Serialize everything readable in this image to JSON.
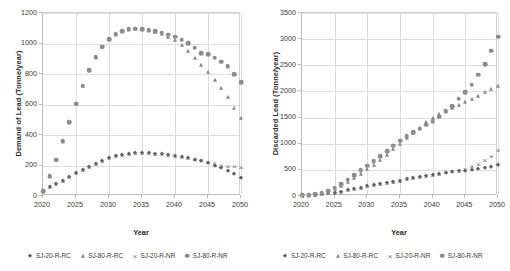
{
  "figure": {
    "panels": [
      "left",
      "right"
    ]
  },
  "series_meta": [
    {
      "key": "sj20rrc",
      "label": "SJ-20-R-RC",
      "marker": "diamond",
      "color": "#5f5f5f"
    },
    {
      "key": "sj80rrc",
      "label": "SJ-80-R-RC",
      "marker": "triangle",
      "color": "#8a8a8a"
    },
    {
      "key": "sj20rnr",
      "label": "SJ-20-R-NR",
      "marker": "cross",
      "color": "#6e6e6e"
    },
    {
      "key": "sj80rnr",
      "label": "SJ-80-R-NR",
      "marker": "circle",
      "color": "#8d8d8d"
    }
  ],
  "chart_data": [
    {
      "type": "scatter",
      "panel": "left",
      "title": "",
      "xlabel": "Year",
      "ylabel": "Demand of Lead (Tonne/year)",
      "xlim": [
        2020,
        2050
      ],
      "ylim": [
        0,
        1200
      ],
      "yticks": [
        0,
        200,
        400,
        600,
        800,
        1000,
        1200
      ],
      "xticks": [
        2020,
        2025,
        2030,
        2035,
        2040,
        2045,
        2050
      ],
      "grid": true,
      "legend_position": "bottom",
      "x": [
        2020,
        2021,
        2022,
        2023,
        2024,
        2025,
        2026,
        2027,
        2028,
        2029,
        2030,
        2031,
        2032,
        2033,
        2034,
        2035,
        2036,
        2037,
        2038,
        2039,
        2040,
        2041,
        2042,
        2043,
        2044,
        2045,
        2046,
        2047,
        2048,
        2049,
        2050
      ],
      "series": [
        {
          "name": "SJ-20-R-RC",
          "marker": "diamond",
          "values": [
            30,
            60,
            78,
            100,
            122,
            148,
            170,
            192,
            212,
            232,
            248,
            262,
            270,
            276,
            280,
            282,
            281,
            278,
            274,
            268,
            262,
            254,
            246,
            238,
            228,
            215,
            200,
            182,
            165,
            142,
            120
          ]
        },
        {
          "name": "SJ-80-R-RC",
          "marker": "triangle",
          "values": [
            30,
            130,
            238,
            360,
            482,
            606,
            724,
            824,
            912,
            980,
            1030,
            1062,
            1082,
            1092,
            1096,
            1094,
            1086,
            1074,
            1060,
            1042,
            1020,
            988,
            950,
            908,
            858,
            812,
            762,
            708,
            646,
            576,
            510
          ]
        },
        {
          "name": "SJ-20-R-NR",
          "marker": "cross",
          "values": [
            30,
            60,
            78,
            100,
            122,
            148,
            170,
            192,
            212,
            232,
            248,
            262,
            270,
            276,
            280,
            282,
            281,
            278,
            274,
            268,
            262,
            256,
            250,
            242,
            234,
            225,
            214,
            206,
            200,
            196,
            190
          ]
        },
        {
          "name": "SJ-80-R-NR",
          "marker": "circle",
          "values": [
            30,
            130,
            238,
            360,
            482,
            606,
            724,
            824,
            912,
            980,
            1030,
            1062,
            1082,
            1092,
            1096,
            1094,
            1088,
            1080,
            1070,
            1058,
            1044,
            1026,
            1002,
            972,
            938,
            930,
            908,
            880,
            852,
            800,
            745
          ]
        }
      ]
    },
    {
      "type": "scatter",
      "panel": "right",
      "title": "",
      "xlabel": "Year",
      "ylabel": "Discarded Lead (Tonne/year)",
      "xlim": [
        2020,
        2050
      ],
      "ylim": [
        0,
        3500
      ],
      "yticks": [
        0,
        500,
        1000,
        1500,
        2000,
        2500,
        3000,
        3500
      ],
      "xticks": [
        2020,
        2025,
        2030,
        2035,
        2040,
        2045,
        2050
      ],
      "grid": true,
      "legend_position": "bottom",
      "x": [
        2020,
        2021,
        2022,
        2023,
        2024,
        2025,
        2026,
        2027,
        2028,
        2029,
        2030,
        2031,
        2032,
        2033,
        2034,
        2035,
        2036,
        2037,
        2038,
        2039,
        2040,
        2041,
        2042,
        2043,
        2044,
        2045,
        2046,
        2047,
        2048,
        2049,
        2050
      ],
      "series": [
        {
          "name": "SJ-20-R-RC",
          "marker": "diamond",
          "values": [
            8,
            14,
            22,
            34,
            48,
            66,
            86,
            108,
            132,
            158,
            182,
            204,
            226,
            250,
            272,
            296,
            318,
            340,
            362,
            382,
            404,
            424,
            442,
            460,
            474,
            486,
            500,
            516,
            534,
            558,
            590
          ]
        },
        {
          "name": "SJ-80-R-RC",
          "marker": "triangle",
          "values": [
            10,
            20,
            34,
            56,
            90,
            140,
            200,
            270,
            350,
            430,
            510,
            600,
            690,
            790,
            890,
            1000,
            1110,
            1210,
            1310,
            1410,
            1500,
            1560,
            1620,
            1690,
            1740,
            1790,
            1850,
            1910,
            1980,
            2050,
            2110
          ]
        },
        {
          "name": "SJ-20-R-NR",
          "marker": "cross",
          "values": [
            8,
            14,
            22,
            34,
            48,
            66,
            86,
            108,
            132,
            158,
            182,
            204,
            226,
            250,
            272,
            296,
            318,
            340,
            362,
            382,
            404,
            428,
            450,
            470,
            486,
            520,
            570,
            620,
            690,
            770,
            880
          ]
        },
        {
          "name": "SJ-80-R-NR",
          "marker": "circle",
          "values": [
            10,
            20,
            36,
            60,
            100,
            160,
            230,
            310,
            400,
            490,
            580,
            670,
            760,
            860,
            960,
            1060,
            1140,
            1220,
            1290,
            1360,
            1430,
            1520,
            1620,
            1720,
            1860,
            1990,
            2130,
            2320,
            2520,
            2780,
            3050
          ]
        }
      ]
    }
  ],
  "legends": [
    {
      "panel": "left",
      "items": [
        "SJ-20-R-RC",
        "SJ-80-R-RC",
        "SJ-20-R-NR",
        "SJ-80-R-NR"
      ]
    },
    {
      "panel": "right",
      "items": [
        "SJ-20-R-RC",
        "SJ-80-R-RC",
        "SJ-20-R-NR",
        "SJ-80-R-NR"
      ]
    }
  ]
}
